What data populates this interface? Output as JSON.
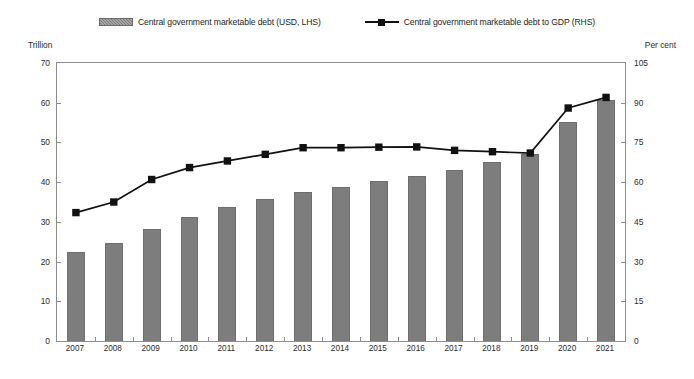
{
  "legend": {
    "bar_label": "Central government marketable debt (USD, LHS)",
    "line_label": "Central government marketable debt to GDP (RHS)",
    "bar_swatch_icon": "bar-swatch-icon",
    "line_swatch_icon": "line-marker-swatch-icon"
  },
  "axes": {
    "left_unit": "Trillion",
    "right_unit": "Per cent"
  },
  "chart_data": {
    "type": "bar",
    "title": "",
    "xlabel": "",
    "ylabel": "Trillion",
    "y2label": "Per cent",
    "categories": [
      "2007",
      "2008",
      "2009",
      "2010",
      "2011",
      "2012",
      "2013",
      "2014",
      "2015",
      "2016",
      "2017",
      "2018",
      "2019",
      "2020",
      "2021"
    ],
    "ylim": [
      0,
      70
    ],
    "y2lim": [
      0,
      105
    ],
    "yticks": [
      0,
      10,
      20,
      30,
      40,
      50,
      60,
      70
    ],
    "y2ticks": [
      0,
      15,
      30,
      45,
      60,
      75,
      90,
      105
    ],
    "grid": false,
    "legend_position": "top-center",
    "series": [
      {
        "name": "Central government marketable debt (USD, LHS)",
        "type": "bar",
        "axis": "left",
        "unit": "Trillion",
        "color": "#7d7d7d",
        "values": [
          22.4,
          24.8,
          28.2,
          31.3,
          33.7,
          35.7,
          37.6,
          38.8,
          40.4,
          41.6,
          43.0,
          45.2,
          47.1,
          55.1,
          60.8
        ]
      },
      {
        "name": "Central government marketable debt to GDP (RHS)",
        "type": "line",
        "axis": "right",
        "unit": "Per cent",
        "color": "#111111",
        "marker": "square",
        "values": [
          48.5,
          52.5,
          61.0,
          65.5,
          68.0,
          70.5,
          73.0,
          73.0,
          73.2,
          73.3,
          72.0,
          71.5,
          71.0,
          88.0,
          92.0
        ]
      }
    ]
  }
}
